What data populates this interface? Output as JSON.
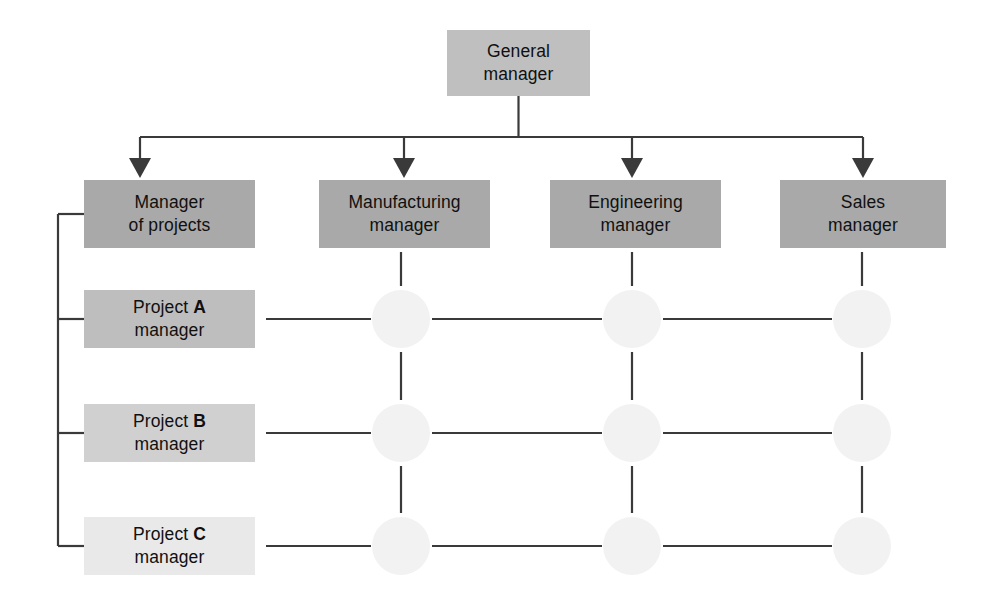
{
  "diagram": {
    "type": "matrix-organization-chart",
    "background": "#ffffff",
    "line_color": "#3a3a3a",
    "dot_color": "#f2f2f2",
    "box_tones": [
      "#bfbfbf",
      "#a9a9a9",
      "#bebebe",
      "#d0d0d0",
      "#e9e9e9"
    ],
    "nodes": {
      "general_manager": {
        "line1": "General",
        "line2": "manager",
        "x": 447,
        "y": 30,
        "w": 143,
        "h": 66,
        "tone": 0
      },
      "functional_row": [
        {
          "name": "manager-of-projects",
          "line1": "Manager",
          "line2": "of projects",
          "x": 84,
          "y": 180,
          "w": 171,
          "h": 68,
          "tone": 1
        },
        {
          "name": "manufacturing-manager",
          "line1": "Manufacturing",
          "line2": "manager",
          "x": 319,
          "y": 180,
          "w": 171,
          "h": 68,
          "tone": 1
        },
        {
          "name": "engineering-manager",
          "line1": "Engineering",
          "line2": "manager",
          "x": 550,
          "y": 180,
          "w": 171,
          "h": 68,
          "tone": 1
        },
        {
          "name": "sales-manager",
          "line1": "Sales",
          "line2": "manager",
          "x": 780,
          "y": 180,
          "w": 166,
          "h": 68,
          "tone": 1
        }
      ],
      "project_rows": [
        {
          "name": "project-a-manager",
          "prefix": "Project ",
          "letter": "A",
          "line2": "manager",
          "x": 84,
          "y": 290,
          "w": 171,
          "h": 58,
          "tone": 2
        },
        {
          "name": "project-b-manager",
          "prefix": "Project ",
          "letter": "B",
          "line2": "manager",
          "x": 84,
          "y": 404,
          "w": 171,
          "h": 58,
          "tone": 3
        },
        {
          "name": "project-c-manager",
          "prefix": "Project ",
          "letter": "C",
          "line2": "manager",
          "x": 84,
          "y": 517,
          "w": 171,
          "h": 58,
          "tone": 4
        }
      ]
    },
    "intersection_dots": {
      "radius": 29,
      "columns_x": [
        401,
        632,
        862
      ],
      "rows_y": [
        319,
        433,
        546
      ]
    },
    "bracket": {
      "x": 58,
      "top": 214,
      "bottom": 546,
      "stub_end": 84,
      "stub_rows_y": [
        214,
        319,
        433,
        546
      ]
    },
    "bus": {
      "y": 137,
      "left": 140,
      "right": 863,
      "stem_from_y": 96,
      "arrow_columns_x": [
        140,
        404,
        632,
        863
      ],
      "arrow_tip_y": 178
    }
  }
}
